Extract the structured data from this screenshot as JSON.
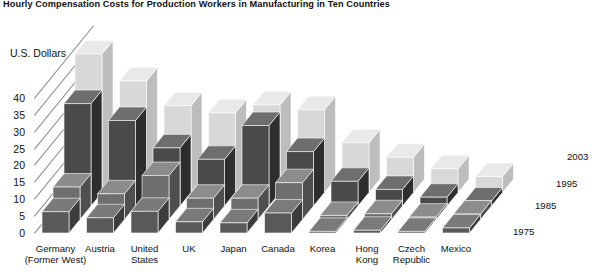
{
  "title": "Hourly Compensation Costs for Production Workers in Manufacturing in Ten Countries",
  "axis": {
    "ylabel": "U.S. Dollars",
    "yticks": [
      "40",
      "35",
      "30",
      "25",
      "20",
      "15",
      "10",
      "5",
      "0"
    ]
  },
  "legend": {
    "labels": [
      "2003",
      "1995",
      "1985",
      "1975"
    ]
  },
  "categories_display": [
    [
      "Germany",
      "(Former West)"
    ],
    [
      "Austria"
    ],
    [
      "United",
      "States"
    ],
    [
      "UK"
    ],
    [
      "Japan"
    ],
    [
      "Canada"
    ],
    [
      "Korea"
    ],
    [
      "Hong",
      "Kong"
    ],
    [
      "Czech",
      "Republic"
    ],
    [
      "Mexico"
    ]
  ],
  "colors": {
    "y2003_front": "#d8d8d8",
    "y2003_top": "#e9e9e9",
    "y2003_side": "#bdbdbd",
    "y1995_front": "#4a4a4a",
    "y1995_top": "#6e6e6e",
    "y1995_side": "#2e2e2e",
    "y1985_front": "#6e6e6e",
    "y1985_top": "#8c8c8c",
    "y1985_side": "#4f4f4f",
    "y1975_front": "#595959",
    "y1975_top": "#7a7a7a",
    "y1975_side": "#3c3c3c",
    "gridline": "#8a8a8a",
    "text": "#111111"
  },
  "chart_data": {
    "type": "bar",
    "title": "Hourly Compensation Costs for Production Workers in Manufacturing in Ten Countries",
    "xlabel": "",
    "ylabel": "U.S. Dollars",
    "ylim": [
      0,
      40
    ],
    "grid": true,
    "legend_position": "right",
    "categories": [
      "Germany (Former West)",
      "Austria",
      "United States",
      "UK",
      "Japan",
      "Canada",
      "Korea",
      "Hong Kong",
      "Czech Republic",
      "Mexico"
    ],
    "series": [
      {
        "name": "1975",
        "values": [
          6.3,
          4.5,
          6.4,
          3.3,
          3.0,
          5.9,
          0.4,
          0.8,
          0.3,
          1.5
        ]
      },
      {
        "name": "1985",
        "values": [
          9.6,
          7.6,
          13.0,
          6.3,
          6.3,
          10.9,
          1.2,
          1.7,
          0.7,
          1.6
        ]
      },
      {
        "name": "1995",
        "values": [
          30.3,
          25.3,
          17.2,
          13.8,
          23.8,
          16.1,
          7.3,
          4.9,
          2.6,
          1.5
        ]
      },
      {
        "name": "2003",
        "values": [
          41.0,
          33.0,
          25.7,
          23.6,
          25.9,
          24.5,
          14.7,
          10.4,
          7.0,
          4.7
        ]
      }
    ]
  }
}
